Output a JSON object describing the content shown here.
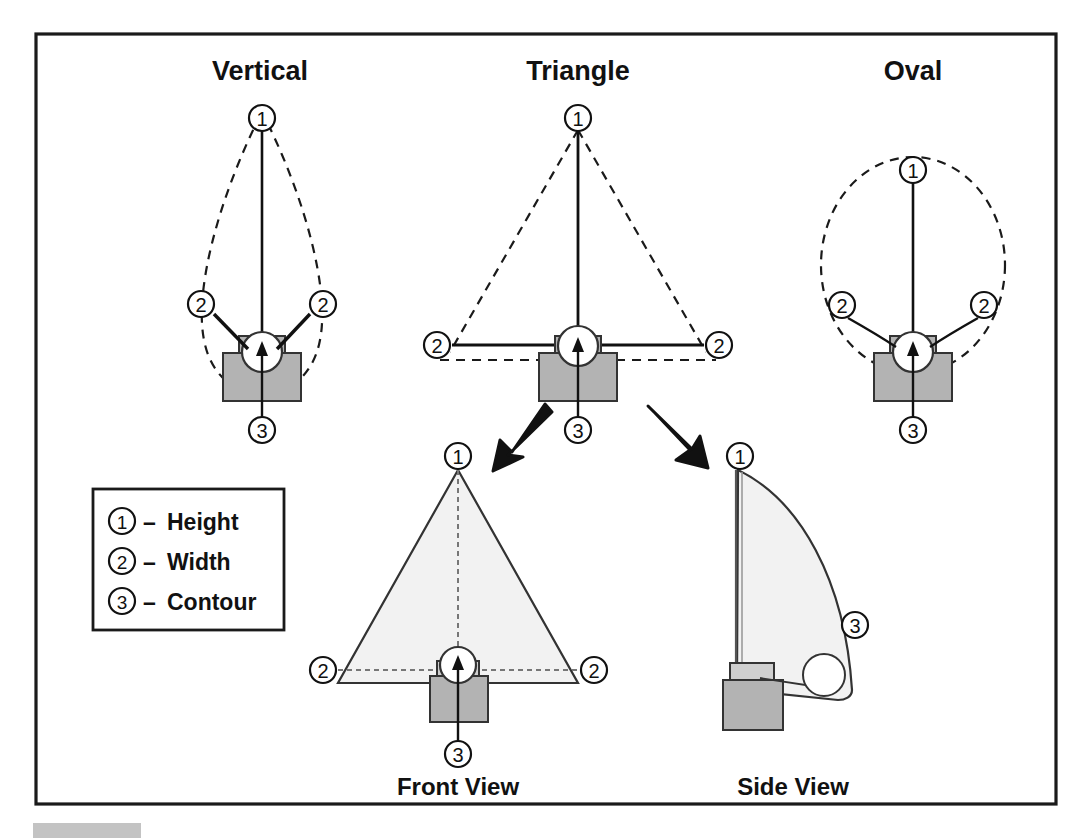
{
  "figure": {
    "kind": "technical-diagram",
    "background_color": "#ffffff",
    "frame_color": "#1a1a1a",
    "ink_color": "#111111",
    "fill_gray": "#b3b3b3",
    "fill_light": "#d8d8d8",
    "fill_pale": "#f0f0f0"
  },
  "top_row": {
    "shapes": [
      {
        "id": "vertical",
        "title": "Vertical"
      },
      {
        "id": "triangle",
        "title": "Triangle"
      },
      {
        "id": "oval",
        "title": "Oval"
      }
    ]
  },
  "bottom_row": {
    "views": [
      {
        "id": "front",
        "title": "Front View"
      },
      {
        "id": "side",
        "title": "Side View"
      }
    ]
  },
  "legend": {
    "entries": [
      {
        "marker": "1",
        "dash": "–",
        "label": "Height"
      },
      {
        "marker": "2",
        "dash": "–",
        "label": "Width"
      },
      {
        "marker": "3",
        "dash": "–",
        "label": "Contour"
      }
    ]
  },
  "markers": {
    "one": "1",
    "two": "2",
    "three": "3"
  },
  "arrows": {
    "left": "arrow-down-left",
    "right": "arrow-down-right"
  }
}
